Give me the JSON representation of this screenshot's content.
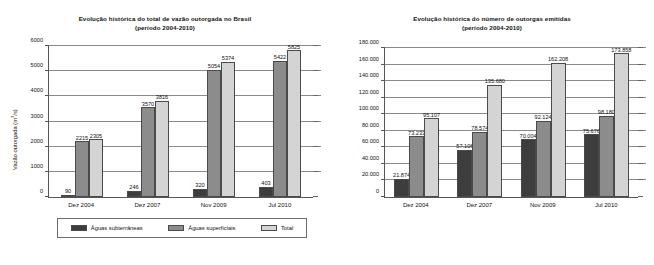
{
  "legend": {
    "items": [
      {
        "key": "sub",
        "label": "Águas subterrâneas",
        "color": "#3d3d3d"
      },
      {
        "key": "sup",
        "label": "Águas superficiais",
        "color": "#8c8c8c"
      },
      {
        "key": "tot",
        "label": "Total",
        "color": "#d4d4d4"
      }
    ]
  },
  "chart_data": [
    {
      "type": "bar",
      "id": "vazao-outorgada",
      "title": "Evolução histórica do total de vazão outorgada no Brasil",
      "subtitle": "(período 2004-2010)",
      "xlabel": "",
      "ylabel": "Vazão outorgada (m³/s)",
      "ylabel_main": "Vazão outorgada (m",
      "ylabel_sup": "3",
      "ylabel_tail": "/s)",
      "categories": [
        "Dez 2004",
        "Dez 2007",
        "Nov 2009",
        "Jul 2010"
      ],
      "ylim": [
        0,
        6000
      ],
      "yticks": [
        0,
        1000,
        2000,
        3000,
        4000,
        5000,
        6000
      ],
      "ytick_labels": [
        "0",
        "1000",
        "2000",
        "3000",
        "4000",
        "5000",
        "6000"
      ],
      "grid": true,
      "legend_position": "bottom",
      "series": [
        {
          "name": "Águas subterrâneas",
          "key": "sub",
          "color": "#3d3d3d",
          "values": [
            90,
            246,
            320,
            403
          ],
          "labels": [
            "90",
            "246",
            "320",
            "403"
          ]
        },
        {
          "name": "Águas superficiais",
          "key": "sup",
          "color": "#8c8c8c",
          "values": [
            2215,
            3570,
            5054,
            5422
          ],
          "labels": [
            "2215",
            "3570",
            "5054",
            "5422"
          ]
        },
        {
          "name": "Total",
          "key": "tot",
          "color": "#d4d4d4",
          "values": [
            2305,
            3816,
            5374,
            5825
          ],
          "labels": [
            "2305",
            "3816",
            "5374",
            "5825"
          ]
        }
      ]
    },
    {
      "type": "bar",
      "id": "numero-outorgas",
      "title": "Evolução histórica do número de outorgas emitidas",
      "subtitle": "(período 2004-2010)",
      "xlabel": "",
      "ylabel": "Número de outorgas emitidas",
      "categories": [
        "Dez 2004",
        "Dez 2007",
        "Nov 2009",
        "Jul 2010"
      ],
      "ylim": [
        0,
        180000
      ],
      "yticks": [
        0,
        20000,
        40000,
        60000,
        80000,
        100000,
        120000,
        140000,
        160000,
        180000
      ],
      "ytick_labels": [
        "0",
        "20.000",
        "40.000",
        "60.000",
        "80.000",
        "100.000",
        "120.000",
        "140.000",
        "160.000",
        "180.000"
      ],
      "grid": true,
      "legend_position": "bottom",
      "series": [
        {
          "name": "Águas subterrâneas",
          "key": "sub",
          "color": "#3d3d3d",
          "values": [
            21874,
            57106,
            70004,
            75676
          ],
          "labels": [
            "21.874",
            "57.106",
            "70.004",
            "75.676"
          ]
        },
        {
          "name": "Águas superficiais",
          "key": "sup",
          "color": "#8c8c8c",
          "values": [
            73233,
            78574,
            92124,
            98180
          ],
          "labels": [
            "73.233",
            "78.574",
            "92.124",
            "98.180"
          ]
        },
        {
          "name": "Total",
          "key": "tot",
          "color": "#d4d4d4",
          "values": [
            95107,
            135680,
            162208,
            173858
          ],
          "labels": [
            "95.107",
            "135.680",
            "162.208",
            "173.858"
          ]
        }
      ]
    }
  ]
}
